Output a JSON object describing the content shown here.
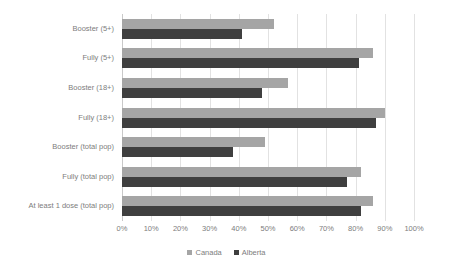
{
  "chart_data": {
    "type": "bar",
    "orientation": "horizontal",
    "title": "",
    "subtitle": "",
    "xlabel": "",
    "ylabel": "",
    "xlim": [
      0,
      100
    ],
    "xtick_labels": [
      "0%",
      "10%",
      "20%",
      "30%",
      "40%",
      "50%",
      "60%",
      "70%",
      "80%",
      "90%",
      "100%"
    ],
    "xtick_values": [
      0,
      10,
      20,
      30,
      40,
      50,
      60,
      70,
      80,
      90,
      100
    ],
    "grid": true,
    "grid_axis": "x",
    "legend_position": "bottom",
    "categories": [
      "Booster (5+)",
      "Fully (5+)",
      "Booster (18+)",
      "Fully (18+)",
      "Booster (total pop)",
      "Fully (total pop)",
      "At least 1 dose (total pop)"
    ],
    "series": [
      {
        "name": "Canada",
        "color": "#a5a5a5",
        "values": [
          52,
          86,
          57,
          90,
          49,
          82,
          86
        ]
      },
      {
        "name": "Alberta",
        "color": "#3f3f3f",
        "values": [
          41,
          81,
          48,
          87,
          38,
          77,
          82
        ]
      }
    ]
  },
  "legend": {
    "items": [
      {
        "label": "Canada",
        "color": "#a5a5a5"
      },
      {
        "label": "Alberta",
        "color": "#3f3f3f"
      }
    ]
  }
}
